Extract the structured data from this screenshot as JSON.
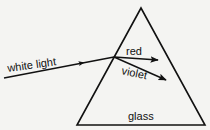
{
  "diagram": {
    "type": "prism-dispersion",
    "background": "#f4f4f2",
    "stroke_color": "#111111",
    "labels": {
      "incident": "white light",
      "ray_upper": "red",
      "ray_lower": "violet",
      "medium": "glass"
    },
    "prism": {
      "apex": [
        141,
        8
      ],
      "base_left": [
        77,
        125
      ],
      "base_right": [
        205,
        125
      ]
    },
    "rays": [
      {
        "name": "white light",
        "from": [
          4,
          78
        ],
        "to": [
          114,
          57
        ]
      },
      {
        "name": "red",
        "from": [
          114,
          57
        ],
        "to": [
          158,
          60
        ]
      },
      {
        "name": "violet",
        "from": [
          114,
          57
        ],
        "to": [
          166,
          80
        ]
      }
    ]
  }
}
